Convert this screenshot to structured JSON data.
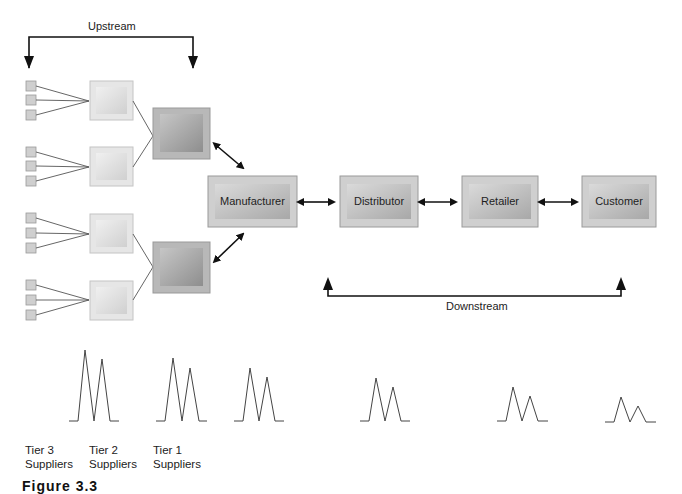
{
  "labels": {
    "upstream": "Upstream",
    "downstream": "Downstream"
  },
  "nodes": {
    "manufacturer": "Manufacturer",
    "distributor": "Distributor",
    "retailer": "Retailer",
    "customer": "Customer"
  },
  "tiers": [
    {
      "line1": "Tier 3",
      "line2": "Suppliers"
    },
    {
      "line1": "Tier 2",
      "line2": "Suppliers"
    },
    {
      "line1": "Tier 1",
      "line2": "Suppliers"
    }
  ],
  "caption": "Figure 3.3",
  "colors": {
    "tier1_box": "#a9a9a9",
    "tier2_box": "#dcdcdc",
    "tier3_box": "#c8c8c8",
    "main_box": "#c0c0c0",
    "arrow": "#111111",
    "line": "#555555"
  }
}
